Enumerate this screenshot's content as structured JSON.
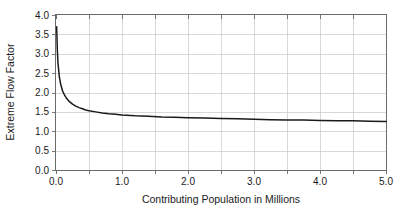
{
  "chart_data": {
    "type": "line",
    "title": "",
    "xlabel": "Contributing Population in Millions",
    "ylabel": "Extreme Flow Factor",
    "xlim": [
      0.0,
      5.0
    ],
    "ylim": [
      0.0,
      4.0
    ],
    "grid": true,
    "legend": "none",
    "x_major_ticks": [
      0.0,
      1.0,
      2.0,
      3.0,
      4.0,
      5.0
    ],
    "x_minor_ticks": [
      0.5,
      1.5,
      2.5,
      3.5,
      4.5
    ],
    "x_tick_labels": [
      "0.0",
      "1.0",
      "2.0",
      "3.0",
      "4.0",
      "5.0"
    ],
    "y_major_ticks": [
      0.0,
      0.5,
      1.0,
      1.5,
      2.0,
      2.5,
      3.0,
      3.5,
      4.0
    ],
    "y_tick_labels": [
      "0.0",
      "0.5",
      "1.0",
      "1.5",
      "2.0",
      "2.5",
      "3.0",
      "3.5",
      "4.0"
    ],
    "series": [
      {
        "name": "Extreme Flow Factor",
        "color": "#1a1a1a",
        "x": [
          0.01,
          0.02,
          0.03,
          0.05,
          0.07,
          0.1,
          0.13,
          0.16,
          0.2,
          0.25,
          0.3,
          0.35,
          0.4,
          0.45,
          0.5,
          0.6,
          0.7,
          0.8,
          0.9,
          1.0,
          1.2,
          1.4,
          1.6,
          1.8,
          2.0,
          2.25,
          2.5,
          2.75,
          3.0,
          3.25,
          3.5,
          3.75,
          4.0,
          4.25,
          4.5,
          4.75,
          5.0
        ],
        "y": [
          3.7,
          3.1,
          2.76,
          2.41,
          2.22,
          2.04,
          1.93,
          1.85,
          1.77,
          1.7,
          1.65,
          1.61,
          1.58,
          1.55,
          1.53,
          1.5,
          1.47,
          1.45,
          1.44,
          1.42,
          1.4,
          1.39,
          1.37,
          1.36,
          1.35,
          1.34,
          1.33,
          1.32,
          1.31,
          1.3,
          1.29,
          1.29,
          1.28,
          1.27,
          1.27,
          1.26,
          1.25
        ]
      }
    ]
  },
  "axes": {
    "x_title": "Contributing Population in Millions",
    "y_title": "Extreme Flow Factor",
    "x_labels": [
      "0.0",
      "1.0",
      "2.0",
      "3.0",
      "4.0",
      "5.0"
    ],
    "y_labels": [
      "0.0",
      "0.5",
      "1.0",
      "1.5",
      "2.0",
      "2.5",
      "3.0",
      "3.5",
      "4.0"
    ]
  },
  "colors": {
    "series": "#1a1a1a",
    "grid": "#c8c8c8",
    "frame": "#6b6b6b",
    "text": "#1a1a1a",
    "background": "#ffffff"
  }
}
